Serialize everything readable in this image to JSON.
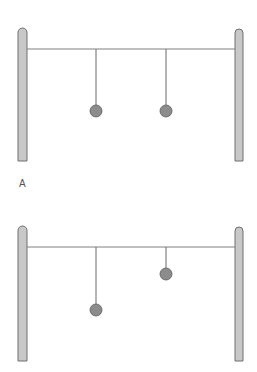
{
  "colors": {
    "post_fill": "#c8c8c8",
    "post_stroke": "#6e6e6e",
    "bar": "#808080",
    "string": "#6a6a6a",
    "ball_fill": "#8c8c8c",
    "ball_stroke": "#5a5a5a",
    "label": "#555555"
  },
  "figures": [
    {
      "id": "A",
      "label": "A",
      "top": 0,
      "posts": [
        {
          "x": 18,
          "y": 28,
          "w": 9,
          "h": 133
        },
        {
          "x": 235,
          "y": 29,
          "w": 8,
          "h": 132
        }
      ],
      "bar": {
        "x1": 27,
        "x2": 235,
        "y": 49
      },
      "pendulums": [
        {
          "x": 96,
          "ball_y": 111,
          "r": 6
        },
        {
          "x": 166,
          "ball_y": 111,
          "r": 6
        }
      ]
    },
    {
      "id": "B",
      "label": "",
      "top": 0,
      "posts": [
        {
          "x": 18,
          "y": 226,
          "w": 9,
          "h": 135
        },
        {
          "x": 235,
          "y": 227,
          "w": 8,
          "h": 134
        }
      ],
      "bar": {
        "x1": 27,
        "x2": 235,
        "y": 247
      },
      "pendulums": [
        {
          "x": 96,
          "ball_y": 310,
          "r": 6
        },
        {
          "x": 166,
          "ball_y": 274,
          "r": 6
        }
      ]
    }
  ]
}
